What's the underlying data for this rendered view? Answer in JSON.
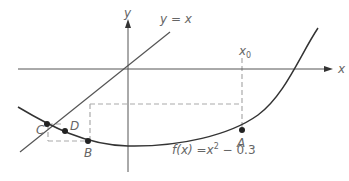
{
  "diagram": {
    "axes": {
      "x_label": "x",
      "y_label": "y"
    },
    "line": {
      "label": "y = x"
    },
    "curve": {
      "label_f": "f",
      "label_rest": "(x) =x",
      "label_exp": "2",
      "label_tail": " − 0.3"
    },
    "start": {
      "label": "x",
      "sub": "0"
    },
    "points": [
      {
        "name": "A",
        "label": "A"
      },
      {
        "name": "B",
        "label": "B"
      },
      {
        "name": "C",
        "label": "C"
      },
      {
        "name": "D",
        "label": "D"
      }
    ],
    "colors": {
      "curve": "#333333",
      "axis": "#555555",
      "dash": "#aaaaaa",
      "text": "#666666"
    }
  }
}
